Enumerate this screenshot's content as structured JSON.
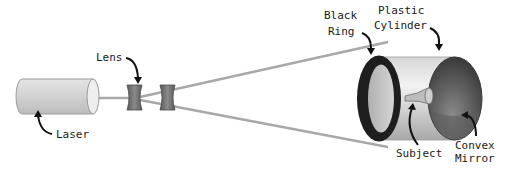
{
  "diagram": {
    "labels": {
      "laser": "Laser",
      "lens": "Lens",
      "black_ring_line1": "Black",
      "black_ring_line2": "Ring",
      "plastic_cylinder_line1": "Plastic",
      "plastic_cylinder_line2": "Cylinder",
      "subject": "Subject",
      "convex_mirror_line1": "Convex",
      "convex_mirror_line2": "Mirror"
    },
    "colors": {
      "beam": "#a8a8a8",
      "laser_body": "#d6d6d6",
      "lens": "#6e6e6e",
      "ring": "#222222",
      "cylinder": "#c8c8c8",
      "mirror": "#555555",
      "arrow": "#111111"
    }
  }
}
